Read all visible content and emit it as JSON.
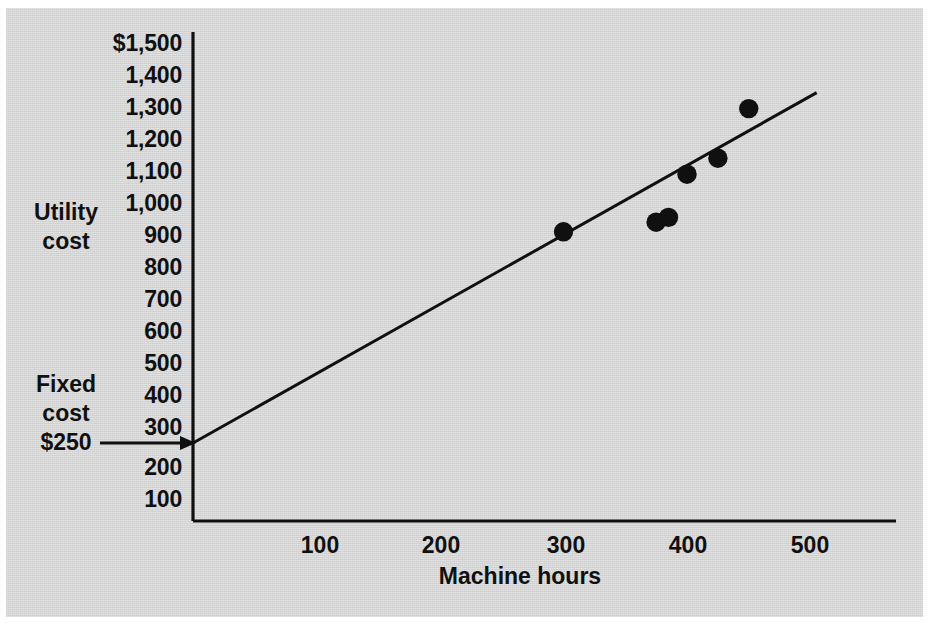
{
  "figure": {
    "background_color": "#d4d4d4",
    "ink_color": "#101010"
  },
  "axes": {
    "y_axis_title_line1": "Utility",
    "y_axis_title_line2": "cost",
    "x_axis_title": "Machine hours",
    "y_ticks": [
      "$1,500",
      "1,400",
      "1,300",
      "1,200",
      "1,100",
      "1,000",
      "900",
      "800",
      "700",
      "600",
      "500",
      "400",
      "300",
      "200",
      "100"
    ],
    "x_ticks": [
      "100",
      "200",
      "300",
      "400",
      "500"
    ]
  },
  "annotation": {
    "fixed_cost_line1": "Fixed",
    "fixed_cost_line2": "cost",
    "fixed_cost_value": "$250"
  },
  "chart_data": {
    "type": "scatter",
    "title": "",
    "xlabel": "Machine hours",
    "ylabel": "Utility cost",
    "xlim": [
      0,
      520
    ],
    "ylim": [
      0,
      1500
    ],
    "grid": false,
    "legend": "none",
    "x_tick_values": [
      100,
      200,
      300,
      400,
      500
    ],
    "y_tick_values": [
      100,
      200,
      300,
      400,
      500,
      600,
      700,
      800,
      900,
      1000,
      1100,
      1200,
      1300,
      1400,
      1500
    ],
    "y_tick_labels": [
      "100",
      "200",
      "300",
      "400",
      "500",
      "600",
      "700",
      "800",
      "900",
      "1,000",
      "1,100",
      "1,200",
      "1,300",
      "1,400",
      "$1,500"
    ],
    "points": [
      {
        "x": 300,
        "y": 910
      },
      {
        "x": 375,
        "y": 940
      },
      {
        "x": 385,
        "y": 955
      },
      {
        "x": 400,
        "y": 1090
      },
      {
        "x": 425,
        "y": 1140
      },
      {
        "x": 450,
        "y": 1295
      }
    ],
    "trend_line": {
      "label": "regression line",
      "intercept": 250,
      "x_start": 0,
      "y_start": 250,
      "x_end": 505,
      "y_end": 1345
    },
    "annotations": [
      {
        "text": "Fixed cost $250",
        "points_to_x": 0,
        "points_to_y": 250
      }
    ]
  }
}
